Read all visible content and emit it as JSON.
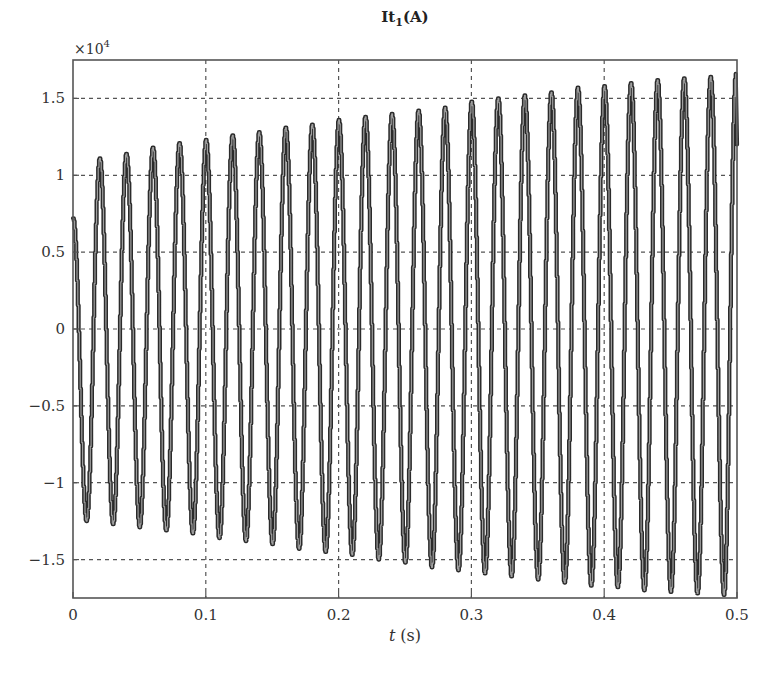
{
  "chart_data": {
    "type": "line",
    "title": "It1(A)",
    "title_main": "It",
    "title_sub": "1",
    "title_unit": "(A)",
    "xlabel_var": "t",
    "xlabel_unit": "(s)",
    "xlabel": "t (s)",
    "ylabel": "",
    "y_multiplier": "×10",
    "y_multiplier_exp": "4",
    "xlim": [
      0,
      0.5
    ],
    "ylim": [
      -1.75,
      1.75
    ],
    "grid": true,
    "grid_style": "dashed",
    "legend": null,
    "x_ticks": [
      0,
      0.1,
      0.2,
      0.3,
      0.4,
      0.5
    ],
    "x_tick_labels": [
      "0",
      "0.1",
      "0.2",
      "0.3",
      "0.4",
      "0.5"
    ],
    "y_ticks": [
      1.5,
      1,
      0.5,
      0,
      -0.5,
      -1,
      -1.5
    ],
    "y_tick_labels": [
      "1.5",
      "1",
      "0.5",
      "0",
      "−0.5",
      "−1",
      "−1.5"
    ],
    "frequency_hz": 50,
    "initial_value": 0.72,
    "series": [
      {
        "name": "It1",
        "color": "#2b2b2b",
        "peak_times": [
          0.02,
          0.04,
          0.06,
          0.08,
          0.1,
          0.12,
          0.14,
          0.16,
          0.18,
          0.2,
          0.22,
          0.24,
          0.26,
          0.28,
          0.3,
          0.32,
          0.34,
          0.36,
          0.38,
          0.4,
          0.42,
          0.44,
          0.46,
          0.48,
          0.499
        ],
        "peak_values": [
          1.11,
          1.14,
          1.18,
          1.21,
          1.23,
          1.26,
          1.28,
          1.31,
          1.33,
          1.36,
          1.38,
          1.4,
          1.42,
          1.44,
          1.48,
          1.5,
          1.52,
          1.54,
          1.57,
          1.58,
          1.6,
          1.62,
          1.63,
          1.64,
          1.66
        ],
        "trough_times": [
          0.01,
          0.03,
          0.05,
          0.07,
          0.09,
          0.11,
          0.13,
          0.15,
          0.17,
          0.19,
          0.21,
          0.23,
          0.25,
          0.27,
          0.29,
          0.31,
          0.33,
          0.35,
          0.37,
          0.39,
          0.41,
          0.43,
          0.45,
          0.47,
          0.49
        ],
        "trough_values": [
          -1.25,
          -1.27,
          -1.29,
          -1.31,
          -1.33,
          -1.36,
          -1.38,
          -1.4,
          -1.43,
          -1.45,
          -1.47,
          -1.5,
          -1.52,
          -1.55,
          -1.57,
          -1.59,
          -1.61,
          -1.63,
          -1.65,
          -1.67,
          -1.68,
          -1.7,
          -1.71,
          -1.72,
          -1.73
        ]
      }
    ]
  }
}
